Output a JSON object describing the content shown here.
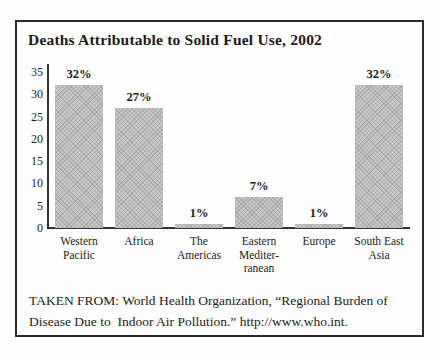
{
  "figure": {
    "title": "Deaths Attributable to Solid Fuel Use, 2002",
    "source_lines": [
      "TAKEN FROM: World Health Organization, “Regional Burden of",
      "Disease Due to  Indoor Air Pollution.” http://www.who.int."
    ]
  },
  "chart_data": {
    "type": "bar",
    "title": "Deaths Attributable to Solid Fuel Use, 2002",
    "categories": [
      "Western Pacific",
      "Africa",
      "The Americas",
      "Eastern Mediterranean",
      "Europe",
      "South East Asia"
    ],
    "category_display_lines": [
      [
        "Western",
        "Pacific"
      ],
      [
        "Africa"
      ],
      [
        "The",
        "Americas"
      ],
      [
        "Eastern",
        "Mediter-",
        "ranean"
      ],
      [
        "Europe"
      ],
      [
        "South East",
        "Asia"
      ]
    ],
    "values": [
      32,
      27,
      1,
      7,
      1,
      32
    ],
    "value_labels": [
      "32%",
      "27%",
      "1%",
      "7%",
      "1%",
      "32%"
    ],
    "xlabel": "",
    "ylabel": "",
    "ylim": [
      0,
      35
    ],
    "yticks": [
      35,
      30,
      25,
      20,
      15,
      10,
      5,
      0
    ],
    "grid": false,
    "legend": "none",
    "bar_color": "#c9c9c9",
    "axis_color": "#333333",
    "source": "TAKEN FROM: World Health Organization, “Regional Burden of Disease Due to Indoor Air Pollution.” http://www.who.int."
  }
}
